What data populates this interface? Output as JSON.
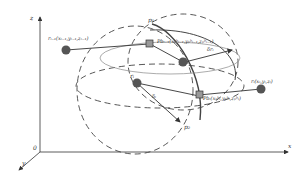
{
  "axes": {
    "z": "z",
    "x": "x",
    "y": "y",
    "origin": "0"
  },
  "labels": {
    "r_prev": "rᵢ₋₁(xᵢ₋₁,yᵢ₋₁,zᵢ₋₁)",
    "r_curr": "rᵢ",
    "r_next": "rᵢ(xᵢ,yᵢ,zᵢ)",
    "p1": "p₁",
    "p2": "p₂",
    "pbs_top": "Pbᵢ₋₁(xₚᵇᵢ₋₁,yₚᵇᵢ₋₁,zₚᵇᵢ₋₁)",
    "pbs_bottom": "Pbᵢ(xₚᵇᵢ,yₚᵇᵢ,zₚᵇᵢ)",
    "delta_upper": "δrᵢ",
    "delta_lower": "δᵢ"
  },
  "colors": {
    "line": "#333333",
    "node": "#555555",
    "dash": "#444444"
  }
}
